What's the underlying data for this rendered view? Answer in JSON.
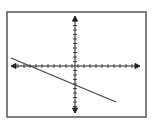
{
  "chart_data": {
    "type": "line",
    "title": "",
    "xlabel": "",
    "ylabel": "",
    "grid": false,
    "xlim": [
      -10,
      10
    ],
    "ylim": [
      -10,
      10
    ],
    "tick_spacing": 1,
    "series": [
      {
        "name": "line",
        "x": [
          -10,
          8
        ],
        "y": [
          1.8,
          -6
        ],
        "slope": -0.43,
        "y_intercept": -2.4
      }
    ]
  },
  "colors": {
    "frame": "#555555",
    "axis": "#222222",
    "line": "#444444",
    "background": "#ffffff"
  }
}
